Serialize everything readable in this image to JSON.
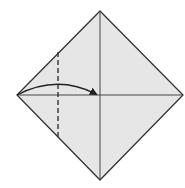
{
  "diagram": {
    "colors": {
      "paper_fill": "#e6e6e6",
      "line": "#333333",
      "background": "#ffffff"
    },
    "vertices": {
      "top": [
        100,
        11
      ],
      "left": [
        17,
        95
      ],
      "right": [
        183,
        95
      ],
      "bottom": [
        100,
        180
      ]
    },
    "center": [
      100,
      95
    ],
    "fold_line": {
      "type": "valley-dashed",
      "x": 58,
      "y1": 52,
      "y2": 138
    },
    "arrow": {
      "from": [
        17,
        95
      ],
      "to": [
        97,
        94
      ],
      "peak_y": 84
    }
  }
}
